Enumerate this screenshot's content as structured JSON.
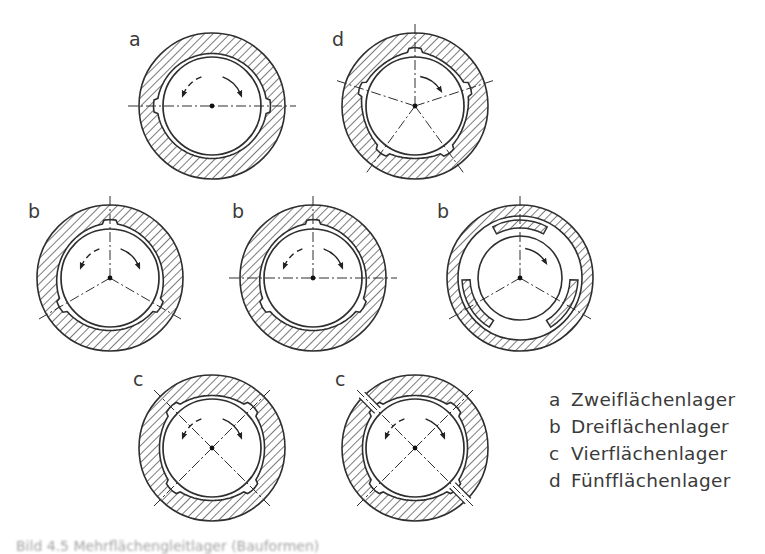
{
  "figure": {
    "bearings": [
      {
        "id": "a-top",
        "label": "a",
        "type": "Zweiflächenlager",
        "pads": 2
      },
      {
        "id": "d-top",
        "label": "d",
        "type": "Fünfflächenlager",
        "pads": 5
      },
      {
        "id": "b-left",
        "label": "b",
        "type": "Dreiflächenlager",
        "pads": 3
      },
      {
        "id": "b-middle",
        "label": "b",
        "type": "Dreiflächenlager",
        "pads": 3
      },
      {
        "id": "b-right",
        "label": "b",
        "type": "Dreiflächenlager",
        "pads": 3,
        "variant": "tilting-pad segments"
      },
      {
        "id": "c-left",
        "label": "c",
        "type": "Vierflächenlager",
        "pads": 4
      },
      {
        "id": "c-right",
        "label": "c",
        "type": "Vierflächenlager",
        "pads": 4
      }
    ]
  },
  "legend": [
    {
      "key": "a",
      "text": "Zweiflächenlager"
    },
    {
      "key": "b",
      "text": "Dreiflächenlager"
    },
    {
      "key": "c",
      "text": "Vierflächenlager"
    },
    {
      "key": "d",
      "text": "Fünfflächenlager"
    }
  ],
  "caption": "Bild 4.5 Mehrflächengleitlager (Bauformen)",
  "colors": {
    "line": "#2f2f2f",
    "background": "#ffffff"
  }
}
